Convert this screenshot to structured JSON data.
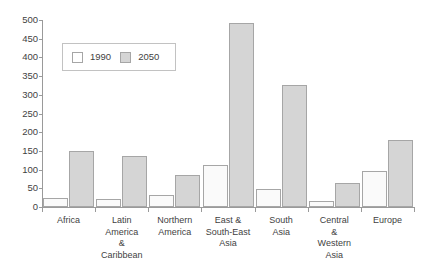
{
  "chart_data": {
    "type": "bar",
    "title": "",
    "xlabel": "",
    "ylabel": "",
    "ylim": [
      0,
      500
    ],
    "yticks": [
      0,
      50,
      100,
      150,
      200,
      250,
      300,
      350,
      400,
      450,
      500
    ],
    "grid": false,
    "legend_position": "upper-left-inside",
    "categories": [
      "Africa",
      "Latin America & Caribbean",
      "Northern America",
      "East & South-East Asia",
      "South Asia",
      "Central & Western Asia",
      "Europe"
    ],
    "category_label_lines": [
      [
        "Africa"
      ],
      [
        "Latin",
        "America",
        "&",
        "Caribbean"
      ],
      [
        "Northern",
        "America"
      ],
      [
        "East &",
        "South-East",
        "Asia"
      ],
      [
        "South",
        "Asia"
      ],
      [
        "Central",
        "&",
        "Western",
        "Asia"
      ],
      [
        "Europe"
      ]
    ],
    "series": [
      {
        "name": "1990",
        "color": "#fafafa",
        "values": [
          25,
          22,
          32,
          112,
          48,
          15,
          95
        ]
      },
      {
        "name": "2050",
        "color": "#d5d5d5",
        "values": [
          150,
          137,
          85,
          492,
          325,
          65,
          180
        ]
      }
    ]
  },
  "legend": {
    "entries": [
      {
        "label": "1990",
        "swatch": "white-square-swatch"
      },
      {
        "label": "2050",
        "swatch": "gray-square-swatch"
      }
    ]
  },
  "axis": {
    "y_tick_labels": [
      "500",
      "450",
      "400",
      "350",
      "300",
      "250",
      "200",
      "150",
      "100",
      "50",
      "0"
    ]
  }
}
